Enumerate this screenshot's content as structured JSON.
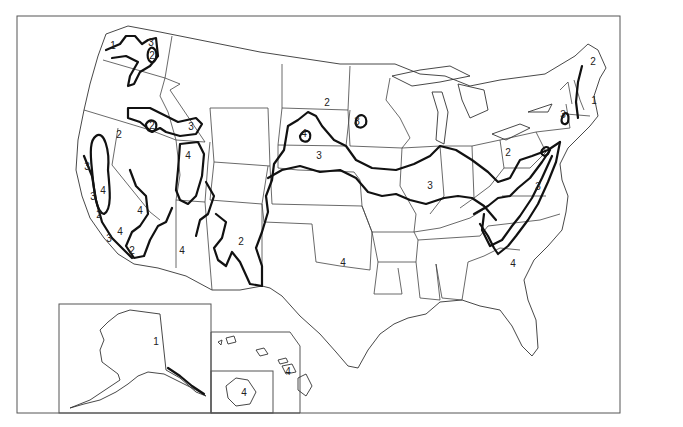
{
  "map": {
    "subject": "United States zone map",
    "background": "#ffffff",
    "line_color": "#111111",
    "zones": [
      "1",
      "2",
      "3",
      "4"
    ],
    "insets": [
      "Alaska",
      "Hawaii",
      "Oahu"
    ],
    "labels": [
      {
        "id": "wa-1",
        "text": "1",
        "x": 113,
        "y": 49
      },
      {
        "id": "wa-3",
        "text": "3",
        "x": 151,
        "y": 46
      },
      {
        "id": "wa-2",
        "text": "2",
        "x": 152,
        "y": 59
      },
      {
        "id": "id-2",
        "text": "2",
        "x": 152,
        "y": 129
      },
      {
        "id": "id-3",
        "text": "3",
        "x": 191,
        "y": 130
      },
      {
        "id": "nv-2",
        "text": "2",
        "x": 119,
        "y": 138
      },
      {
        "id": "ut-4",
        "text": "4",
        "x": 188,
        "y": 159
      },
      {
        "id": "ca-3a",
        "text": "3",
        "x": 87,
        "y": 170
      },
      {
        "id": "ca-4",
        "text": "4",
        "x": 103,
        "y": 194
      },
      {
        "id": "ca-3b",
        "text": "3",
        "x": 93,
        "y": 200
      },
      {
        "id": "ca-2a",
        "text": "2",
        "x": 99,
        "y": 218
      },
      {
        "id": "nv-4",
        "text": "4",
        "x": 140,
        "y": 214
      },
      {
        "id": "ca-4b",
        "text": "4",
        "x": 120,
        "y": 235
      },
      {
        "id": "ca-3c",
        "text": "3",
        "x": 109,
        "y": 242
      },
      {
        "id": "ca-2b",
        "text": "2",
        "x": 132,
        "y": 254
      },
      {
        "id": "az-4",
        "text": "4",
        "x": 182,
        "y": 254
      },
      {
        "id": "nm-2",
        "text": "2",
        "x": 241,
        "y": 245
      },
      {
        "id": "nd-2",
        "text": "2",
        "x": 327,
        "y": 106
      },
      {
        "id": "mn-3",
        "text": "3",
        "x": 357,
        "y": 125
      },
      {
        "id": "sd-4",
        "text": "4",
        "x": 304,
        "y": 137
      },
      {
        "id": "ne-3",
        "text": "3",
        "x": 319,
        "y": 159
      },
      {
        "id": "mo-3",
        "text": "3",
        "x": 430,
        "y": 189
      },
      {
        "id": "oh-2",
        "text": "2",
        "x": 508,
        "y": 156
      },
      {
        "id": "me-2",
        "text": "2",
        "x": 593,
        "y": 65
      },
      {
        "id": "nh-1",
        "text": "1",
        "x": 594,
        "y": 104
      },
      {
        "id": "ny-3",
        "text": "3",
        "x": 563,
        "y": 118
      },
      {
        "id": "va-3",
        "text": "3",
        "x": 538,
        "y": 190
      },
      {
        "id": "sc-4",
        "text": "4",
        "x": 513,
        "y": 267
      },
      {
        "id": "tx-4",
        "text": "4",
        "x": 343,
        "y": 266
      },
      {
        "id": "ak-1",
        "text": "1",
        "x": 156,
        "y": 345
      },
      {
        "id": "hi-4a",
        "text": "4",
        "x": 288,
        "y": 375
      },
      {
        "id": "hi-4b",
        "text": "4",
        "x": 244,
        "y": 396
      }
    ]
  }
}
